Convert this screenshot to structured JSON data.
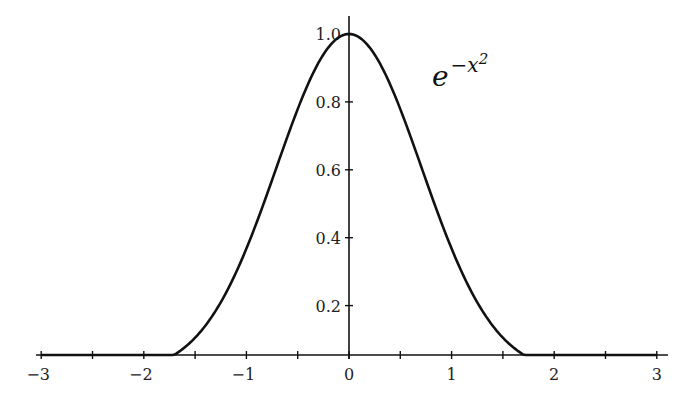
{
  "chart_data": {
    "type": "line",
    "title": "",
    "function_label": "e^{-x^2}",
    "label_base": "e",
    "label_exponent": "−x",
    "label_exponent_power": "2",
    "xlabel": "",
    "ylabel": "",
    "xlim": [
      -3,
      3
    ],
    "ylim": [
      0.026,
      1.05
    ],
    "x_ticks": [
      "−3",
      "−2",
      "−1",
      "0",
      "1",
      "2",
      "3"
    ],
    "y_ticks": [
      "0.2",
      "0.4",
      "0.6",
      "0.8",
      "1.0"
    ],
    "grid": false,
    "legend": null,
    "series": [
      {
        "name": "exp(-x^2)",
        "x": [
          -3,
          -2.5,
          -2,
          -1.5,
          -1,
          -0.5,
          0,
          0.5,
          1,
          1.5,
          2,
          2.5,
          3
        ],
        "values": [
          0.0001,
          0.0019,
          0.0183,
          0.1054,
          0.3679,
          0.7788,
          1.0,
          0.7788,
          0.3679,
          0.1054,
          0.0183,
          0.0019,
          0.0001
        ]
      }
    ]
  }
}
